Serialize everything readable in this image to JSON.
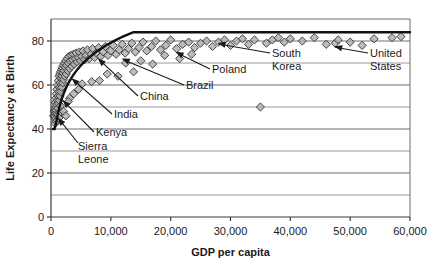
{
  "chart_data": {
    "type": "scatter",
    "title": "",
    "xlabel": "GDP per capita",
    "ylabel": "Life Expectancy at Birth",
    "xlim": [
      0,
      60000
    ],
    "ylim": [
      0,
      90
    ],
    "grid": true,
    "legend": "none",
    "x_ticks": [
      0,
      10000,
      20000,
      30000,
      40000,
      50000,
      60000
    ],
    "x_tick_labels": [
      "0",
      "10,000",
      "20,000",
      "30,000",
      "40,000",
      "50,000",
      "60,000"
    ],
    "y_ticks": [
      0,
      20,
      40,
      60,
      80
    ],
    "y_tick_labels": [
      "0",
      "20",
      "40",
      "60",
      "80"
    ],
    "y_minor_gridlines": [
      10,
      30,
      50,
      70
    ],
    "marker": "diamond",
    "marker_fill": "#b0b0b0",
    "marker_stroke": "#333333",
    "trend_stroke": "#111111",
    "points": [
      [
        430,
        46
      ],
      [
        520,
        48
      ],
      [
        600,
        45.5
      ],
      [
        640,
        49
      ],
      [
        700,
        47
      ],
      [
        740,
        52
      ],
      [
        760,
        44.5
      ],
      [
        800,
        50
      ],
      [
        830,
        54
      ],
      [
        870,
        48.5
      ],
      [
        900,
        56
      ],
      [
        940,
        51
      ],
      [
        980,
        58
      ],
      [
        1010,
        47
      ],
      [
        1060,
        53
      ],
      [
        1100,
        60
      ],
      [
        1140,
        49.5
      ],
      [
        1180,
        55
      ],
      [
        1220,
        62
      ],
      [
        1260,
        51.5
      ],
      [
        1300,
        57
      ],
      [
        1350,
        64
      ],
      [
        1390,
        53
      ],
      [
        1430,
        59
      ],
      [
        1470,
        65
      ],
      [
        1520,
        55
      ],
      [
        1560,
        61
      ],
      [
        1600,
        66
      ],
      [
        1650,
        57
      ],
      [
        1700,
        63
      ],
      [
        1760,
        67
      ],
      [
        1800,
        59
      ],
      [
        1860,
        64
      ],
      [
        1900,
        68
      ],
      [
        1960,
        61
      ],
      [
        2020,
        65.5
      ],
      [
        2080,
        69
      ],
      [
        2140,
        62.5
      ],
      [
        2200,
        66.5
      ],
      [
        2260,
        70
      ],
      [
        2330,
        64
      ],
      [
        2400,
        68
      ],
      [
        2470,
        71
      ],
      [
        2550,
        65
      ],
      [
        2620,
        69
      ],
      [
        2700,
        72
      ],
      [
        2800,
        66.5
      ],
      [
        2900,
        70
      ],
      [
        3000,
        73
      ],
      [
        3120,
        67.5
      ],
      [
        3240,
        71
      ],
      [
        3360,
        73.5
      ],
      [
        3480,
        68.5
      ],
      [
        3600,
        71.5
      ],
      [
        3760,
        74
      ],
      [
        3900,
        69.5
      ],
      [
        4060,
        72
      ],
      [
        4200,
        74.5
      ],
      [
        4380,
        70.5
      ],
      [
        4560,
        72.5
      ],
      [
        4750,
        75
      ],
      [
        4940,
        71
      ],
      [
        5140,
        73
      ],
      [
        5360,
        75.5
      ],
      [
        5600,
        71.5
      ],
      [
        5840,
        73.5
      ],
      [
        6100,
        76
      ],
      [
        6380,
        72
      ],
      [
        6660,
        74
      ],
      [
        6960,
        76.5
      ],
      [
        7280,
        72.5
      ],
      [
        7600,
        74.5
      ],
      [
        7960,
        77
      ],
      [
        8320,
        73
      ],
      [
        8700,
        75
      ],
      [
        9100,
        77.5
      ],
      [
        9520,
        73.5
      ],
      [
        9960,
        75.5
      ],
      [
        10400,
        78
      ],
      [
        10900,
        74
      ],
      [
        11400,
        76
      ],
      [
        11900,
        78.5
      ],
      [
        12400,
        74.5
      ],
      [
        12950,
        76.5
      ],
      [
        13500,
        79
      ],
      [
        14100,
        75
      ],
      [
        14700,
        77
      ],
      [
        15400,
        79.5
      ],
      [
        16000,
        75.5
      ],
      [
        16800,
        77.5
      ],
      [
        17500,
        80
      ],
      [
        18300,
        76
      ],
      [
        19200,
        78
      ],
      [
        20000,
        80.5
      ],
      [
        21000,
        76.5
      ],
      [
        22000,
        78.5
      ],
      [
        23000,
        79.5
      ],
      [
        24000,
        77
      ],
      [
        25000,
        79
      ],
      [
        26000,
        80
      ],
      [
        27000,
        77.5
      ],
      [
        28000,
        79.5
      ],
      [
        29000,
        80.5
      ],
      [
        30000,
        78
      ],
      [
        31000,
        80
      ],
      [
        32000,
        81
      ],
      [
        33000,
        78.5
      ],
      [
        34000,
        80.5
      ],
      [
        35000,
        50
      ],
      [
        36000,
        79
      ],
      [
        37000,
        80.5
      ],
      [
        38000,
        81.5
      ],
      [
        39000,
        79.5
      ],
      [
        40000,
        81
      ],
      [
        42000,
        80
      ],
      [
        44000,
        81.5
      ],
      [
        46000,
        78.5
      ],
      [
        47500,
        79
      ],
      [
        48000,
        80.5
      ],
      [
        50000,
        79.5
      ],
      [
        52000,
        78
      ],
      [
        54000,
        81
      ],
      [
        57000,
        81.5
      ],
      [
        58500,
        82
      ],
      [
        1200,
        46.5
      ],
      [
        1500,
        47.5
      ],
      [
        2100,
        48
      ],
      [
        2500,
        46
      ],
      [
        3100,
        54
      ],
      [
        3800,
        56
      ],
      [
        4600,
        58
      ],
      [
        5200,
        60.5
      ],
      [
        6800,
        61.5
      ],
      [
        8100,
        62
      ],
      [
        9400,
        65
      ],
      [
        11200,
        64
      ],
      [
        13800,
        66
      ],
      [
        17000,
        69.5
      ],
      [
        21500,
        72
      ],
      [
        690,
        42.5
      ],
      [
        880,
        43.5
      ],
      [
        1050,
        44
      ],
      [
        1330,
        45
      ],
      [
        1580,
        50.5
      ],
      [
        2900,
        52.5
      ],
      [
        12500,
        70
      ],
      [
        15000,
        71
      ],
      [
        19000,
        73.5
      ],
      [
        23500,
        74
      ]
    ],
    "trend_curve_note": "logarithmic fit rising from ~46 at low GDP to ~82 at 60,000",
    "annotations": [
      {
        "label": "Sierra Leone",
        "lines": [
          "Sierra",
          "Leone"
        ],
        "point_x": 800,
        "point_y": 46
      },
      {
        "label": "Kenya",
        "lines": [
          "Kenya"
        ],
        "point_x": 1600,
        "point_y": 54
      },
      {
        "label": "India",
        "lines": [
          "India"
        ],
        "point_x": 3100,
        "point_y": 64
      },
      {
        "label": "China",
        "lines": [
          "China"
        ],
        "point_x": 7500,
        "point_y": 73
      },
      {
        "label": "Brazil",
        "lines": [
          "Brazil"
        ],
        "point_x": 11500,
        "point_y": 73
      },
      {
        "label": "Poland",
        "lines": [
          "Poland"
        ],
        "point_x": 20500,
        "point_y": 76
      },
      {
        "label": "South Korea",
        "lines": [
          "South",
          "Korea"
        ],
        "point_x": 27500,
        "point_y": 80
      },
      {
        "label": "United States",
        "lines": [
          "United",
          "States"
        ],
        "point_x": 47000,
        "point_y": 78.5
      }
    ]
  }
}
